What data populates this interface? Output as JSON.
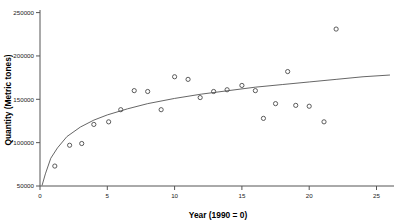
{
  "chart_data": {
    "type": "scatter",
    "title": "",
    "xlabel": "Year (1990 = 0)",
    "ylabel": "Quantity (Metric tones)",
    "xlim": [
      0,
      26.3
    ],
    "ylim": [
      50000,
      253000
    ],
    "xticks": [
      0,
      5,
      10,
      15,
      20,
      25
    ],
    "xticklabels": [
      "0",
      "5",
      "10",
      "15",
      "20",
      "25"
    ],
    "yticks": [
      50000,
      100000,
      150000,
      200000,
      250000
    ],
    "yticklabels": [
      "50000",
      "100000",
      "150000",
      "200000",
      "250000"
    ],
    "grid": false,
    "legend": null,
    "marker": "open-circle",
    "series": [
      {
        "name": "observed",
        "x": [
          1.1,
          2.2,
          3.1,
          4.0,
          5.1,
          6.0,
          7.0,
          8.0,
          9.0,
          10.0,
          11.0,
          11.9,
          12.9,
          13.9,
          15.0,
          16.0,
          16.6,
          17.5,
          18.4,
          19.0,
          20.0,
          21.1,
          22.0
        ],
        "y": [
          73000,
          97000,
          99000,
          121000,
          124000,
          138000,
          160000,
          159000,
          138000,
          176000,
          173000,
          152000,
          159000,
          161000,
          166000,
          160000,
          128000,
          145000,
          182000,
          143000,
          142000,
          124000,
          231000
        ]
      }
    ],
    "fit_curve": {
      "name": "logarithmic-fit",
      "x": [
        0.15,
        0.4,
        0.8,
        1.3,
        2.0,
        3.0,
        4.0,
        5.0,
        6.5,
        8.0,
        10.0,
        12.0,
        14.0,
        16.0,
        18.0,
        20.0,
        22.0,
        24.0,
        26.0
      ],
      "y": [
        50500,
        64000,
        82000,
        94000,
        107000,
        118000,
        126000,
        132000,
        139000,
        145000,
        151000,
        156000,
        160000,
        164000,
        167000,
        170000,
        173000,
        176000,
        178000
      ]
    }
  }
}
